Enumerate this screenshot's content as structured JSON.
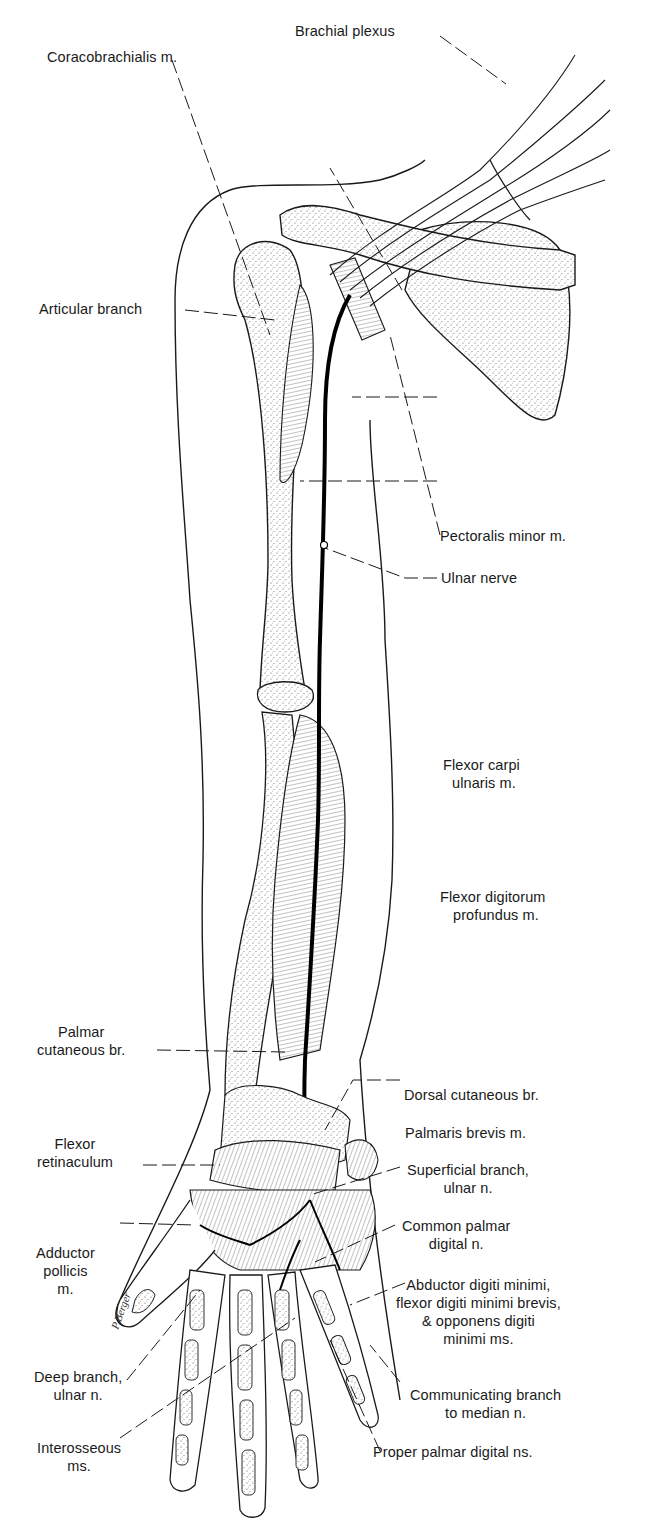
{
  "figure": {
    "signature": "P. Berger"
  },
  "labels": {
    "brachial_plexus": "Brachial plexus",
    "coracobrachialis": "Coracobrachialis m.",
    "pectoralis_minor": "Pectoralis minor m.",
    "ulnar_nerve": "Ulnar nerve",
    "articular_branch": "Articular branch",
    "flexor_carpi_ulnaris_1": "Flexor carpi",
    "flexor_carpi_ulnaris_2": "ulnaris m.",
    "flexor_digitorum_profundus_1": "Flexor digitorum",
    "flexor_digitorum_profundus_2": "profundus m.",
    "palmar_cutaneous_1": "Palmar",
    "palmar_cutaneous_2": "cutaneous br.",
    "dorsal_cutaneous": "Dorsal cutaneous br.",
    "palmaris_brevis": "Palmaris brevis m.",
    "flexor_retinaculum_1": "Flexor",
    "flexor_retinaculum_2": "retinaculum",
    "superficial_branch_1": "Superficial branch,",
    "superficial_branch_2": "ulnar n.",
    "common_palmar_1": "Common palmar",
    "common_palmar_2": "digital n.",
    "adductor_pollicis_1": "Adductor",
    "adductor_pollicis_2": "pollicis",
    "adductor_pollicis_3": "m.",
    "abductor_digiti_1": "Abductor digiti minimi,",
    "abductor_digiti_2": "flexor digiti minimi brevis,",
    "abductor_digiti_3": "& opponens digiti",
    "abductor_digiti_4": "minimi ms.",
    "deep_branch_1": "Deep branch,",
    "deep_branch_2": "ulnar n.",
    "communicating_1": "Communicating branch",
    "communicating_2": "to median n.",
    "interosseous_1": "Interosseous",
    "interosseous_2": "ms.",
    "proper_palmar": "Proper palmar digital ns."
  }
}
